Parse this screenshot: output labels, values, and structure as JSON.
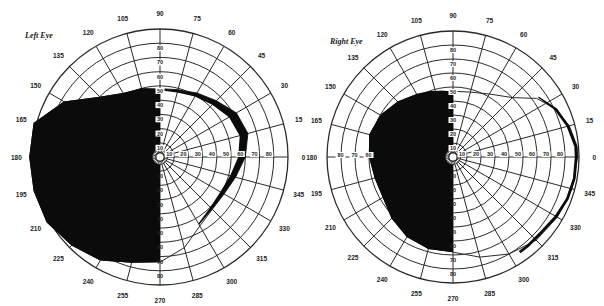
{
  "figure": {
    "background": "#ffffff",
    "line_color": "#2a2a2a",
    "fill_color": "#0b0b0b"
  },
  "charts": [
    {
      "id": "left",
      "label": "Left Eye",
      "label_pos": [
        25,
        36
      ],
      "center": [
        160,
        157
      ],
      "radius": 128,
      "rings_deg": [
        10,
        20,
        30,
        40,
        50,
        60,
        70,
        80,
        90
      ],
      "meridian_step": 15,
      "angle_labels": [
        "0",
        "15",
        "30",
        "45",
        "60",
        "75",
        "90",
        "105",
        "120",
        "135",
        "150",
        "165",
        "180",
        "195",
        "210",
        "225",
        "240",
        "255",
        "270",
        "285",
        "300",
        "315",
        "330",
        "345"
      ],
      "radial_labels_up": [
        "10",
        "20",
        "30",
        "40",
        "50",
        "60",
        "70",
        "80"
      ],
      "radial_labels_right": [
        "10",
        "20",
        "30",
        "40",
        "50",
        "60",
        "70",
        "80"
      ],
      "radial_labels_down": [
        "10",
        "20",
        "30",
        "40",
        "50",
        "60",
        "70",
        "80"
      ],
      "scotoma": {
        "description": "Dense left homonymous hemianopic defect covering entire temporal field left of vertical meridian",
        "points_polar": [
          [
            90,
            48
          ],
          [
            105,
            50
          ],
          [
            120,
            52
          ],
          [
            135,
            60
          ],
          [
            150,
            78
          ],
          [
            165,
            92
          ],
          [
            180,
            92
          ],
          [
            195,
            92
          ],
          [
            210,
            92
          ],
          [
            225,
            88
          ],
          [
            240,
            84
          ],
          [
            255,
            77
          ],
          [
            270,
            74
          ],
          [
            270,
            0
          ],
          [
            90,
            0
          ]
        ]
      },
      "crescent": {
        "description": "Narrow dark crescent marking peripheral boundary of remaining nasal field",
        "outer_polar": [
          [
            90,
            48
          ],
          [
            75,
            49
          ],
          [
            60,
            52
          ],
          [
            45,
            56
          ],
          [
            30,
            62
          ],
          [
            15,
            64
          ],
          [
            0,
            60
          ],
          [
            345,
            55
          ],
          [
            330,
            52
          ],
          [
            315,
            52
          ],
          [
            300,
            55
          ]
        ],
        "inner_polar": [
          [
            300,
            54
          ],
          [
            315,
            50
          ],
          [
            330,
            49
          ],
          [
            345,
            51
          ],
          [
            0,
            55
          ],
          [
            15,
            58
          ],
          [
            30,
            56
          ],
          [
            45,
            52
          ],
          [
            60,
            49
          ],
          [
            75,
            47
          ],
          [
            90,
            47
          ]
        ]
      },
      "boundary_polar": [
        [
          90,
          48
        ],
        [
          75,
          49
        ],
        [
          60,
          52
        ],
        [
          45,
          56
        ],
        [
          30,
          62
        ],
        [
          15,
          64
        ],
        [
          0,
          60
        ],
        [
          345,
          55
        ],
        [
          330,
          52
        ],
        [
          315,
          52
        ],
        [
          300,
          56
        ],
        [
          285,
          66
        ],
        [
          270,
          74
        ]
      ]
    },
    {
      "id": "right",
      "label": "Right Eye",
      "label_pos": [
        330,
        42
      ],
      "center": [
        453,
        157
      ],
      "radius": 126,
      "rings_deg": [
        10,
        20,
        30,
        40,
        50,
        60,
        70,
        80,
        90
      ],
      "meridian_step": 15,
      "angle_labels": [
        "0",
        "15",
        "30",
        "45",
        "60",
        "75",
        "90",
        "105",
        "120",
        "135",
        "150",
        "165",
        "180",
        "195",
        "210",
        "225",
        "240",
        "255",
        "270",
        "285",
        "300",
        "315",
        "330",
        "345"
      ],
      "radial_labels_up": [
        "10",
        "20",
        "30",
        "40",
        "50",
        "60",
        "70",
        "80"
      ],
      "radial_labels_right": [
        "10",
        "20",
        "30",
        "40",
        "50",
        "60",
        "70",
        "80"
      ],
      "radial_labels_left": [
        "10",
        "20",
        "30",
        "40",
        "50",
        "60",
        "70",
        "80"
      ],
      "radial_labels_down": [
        "10",
        "20",
        "30",
        "40",
        "50",
        "60",
        "70",
        "80"
      ],
      "scotoma": {
        "description": "Dense left homonymous hemianopic defect in nasal field of right eye, left of vertical meridian",
        "points_polar": [
          [
            90,
            47
          ],
          [
            100,
            48
          ],
          [
            110,
            50
          ],
          [
            120,
            52
          ],
          [
            135,
            56
          ],
          [
            150,
            60
          ],
          [
            165,
            62
          ],
          [
            180,
            60
          ],
          [
            195,
            58
          ],
          [
            210,
            58
          ],
          [
            225,
            62
          ],
          [
            240,
            66
          ],
          [
            255,
            68
          ],
          [
            270,
            68
          ],
          [
            270,
            0
          ],
          [
            90,
            0
          ]
        ]
      },
      "crescent": {
        "description": "Dark crescent along temporal peripheral boundary",
        "outer_polar": [
          [
            35,
            75
          ],
          [
            25,
            82
          ],
          [
            15,
            86
          ],
          [
            5,
            89
          ],
          [
            0,
            89
          ],
          [
            350,
            89
          ],
          [
            340,
            88
          ],
          [
            330,
            86
          ],
          [
            320,
            84
          ],
          [
            310,
            84
          ],
          [
            305,
            84
          ]
        ],
        "inner_polar": [
          [
            305,
            82
          ],
          [
            310,
            82
          ],
          [
            320,
            82
          ],
          [
            330,
            84
          ],
          [
            340,
            86
          ],
          [
            350,
            87
          ],
          [
            0,
            87
          ],
          [
            5,
            87
          ],
          [
            15,
            84
          ],
          [
            25,
            80
          ],
          [
            35,
            74
          ]
        ]
      },
      "boundary_polar": [
        [
          90,
          47
        ],
        [
          75,
          48
        ],
        [
          60,
          52
        ],
        [
          45,
          60
        ],
        [
          35,
          73
        ],
        [
          25,
          81
        ],
        [
          15,
          86
        ],
        [
          5,
          89
        ],
        [
          0,
          89
        ],
        [
          345,
          88
        ],
        [
          330,
          86
        ],
        [
          315,
          84
        ],
        [
          300,
          80
        ],
        [
          285,
          74
        ],
        [
          270,
          68
        ]
      ]
    }
  ]
}
